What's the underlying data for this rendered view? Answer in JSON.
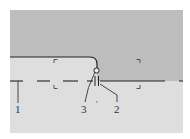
{
  "figure": {
    "background": "#ffffff",
    "panel": {
      "x": 10,
      "y": 10,
      "width": 173,
      "height": 123
    },
    "colors": {
      "upper_region": "#bdbdbd",
      "lower_region": "#dedede",
      "line": "#222222",
      "label": "#333333"
    },
    "labels": [
      {
        "id": "1",
        "text": "1",
        "x": 18,
        "y": 112
      },
      {
        "id": "3",
        "text": "3",
        "x": 84,
        "y": 112
      },
      {
        "id": "2",
        "text": "2",
        "x": 117,
        "y": 112
      }
    ],
    "small_mark": "'"
  }
}
